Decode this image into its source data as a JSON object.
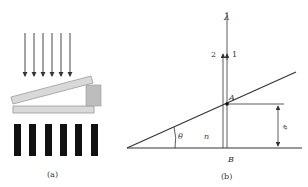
{
  "panel_a": {
    "caption": "(a)",
    "incident_arrows": 6,
    "fringe_bars": 6
  },
  "panel_b": {
    "caption": "(b)",
    "wavelength_label": "λ",
    "ray1_label": "1",
    "ray2_label": "2",
    "point_a_label": "A",
    "point_b_label": "B",
    "angle_label": "θ",
    "index_label": "n",
    "thickness_label": "e"
  },
  "colors": {
    "line": "#333333",
    "plate_fill": "#d9d9d9",
    "plate_edge": "#9a9a9a",
    "spacer_fill": "#bdbdbd",
    "fringe_dark": "#111111"
  }
}
